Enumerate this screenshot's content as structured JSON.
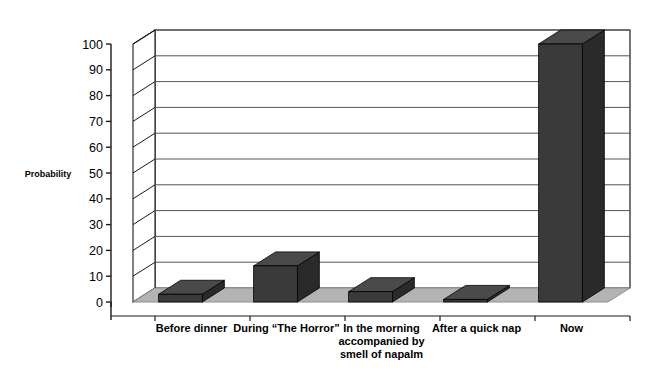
{
  "chart_data": {
    "type": "bar",
    "title": "",
    "subtitle": "",
    "xlabel": "",
    "ylabel": "Probability",
    "ylim": [
      0,
      100
    ],
    "ytick_step": 10,
    "yticks": [
      0,
      10,
      20,
      30,
      40,
      50,
      60,
      70,
      80,
      90,
      100
    ],
    "ytick_labels": [
      "0",
      "10",
      "20",
      "30",
      "40",
      "50",
      "60",
      "70",
      "80",
      "90",
      "100"
    ],
    "grid": true,
    "grid_axis": "y",
    "legend": false,
    "legend_position": "none",
    "style": "3d-column",
    "categories": [
      "Before dinner",
      "During “The Horror”",
      "In the morning accompanied by smell of napalm",
      "After a quick nap",
      "Now"
    ],
    "category_lines": [
      [
        "Before dinner"
      ],
      [
        "During “The Horror”"
      ],
      [
        "In the morning",
        "accompanied by",
        "smell of napalm"
      ],
      [
        "After a quick nap"
      ],
      [
        "Now"
      ]
    ],
    "values": [
      3,
      14,
      4,
      1,
      100
    ],
    "series": [
      {
        "name": "Probability",
        "values": [
          3,
          14,
          4,
          1,
          100
        ]
      }
    ]
  },
  "colors": {
    "bar_front": "#3a3a3a",
    "bar_top": "#4a4a4a",
    "bar_side": "#2a2a2a",
    "floor": "#b3b3b3",
    "floor_edge": "#8f8f8f",
    "wall": "#ffffff",
    "gridline": "#555555",
    "axis_line": "#1a1a1a",
    "text": "#000000",
    "background": "#ffffff"
  },
  "axis": {
    "y_title": "Probability"
  }
}
